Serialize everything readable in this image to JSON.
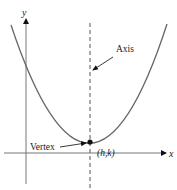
{
  "diagram": {
    "axes": {
      "x_label": "x",
      "y_label": "y"
    },
    "annotations": {
      "axis_label": "Axis",
      "vertex_label": "Vertex",
      "vertex_coords": "(h,k)"
    },
    "colors": {
      "curve": "#555555",
      "axes": "#666666",
      "text": "#222222",
      "background": "#ffffff"
    }
  }
}
